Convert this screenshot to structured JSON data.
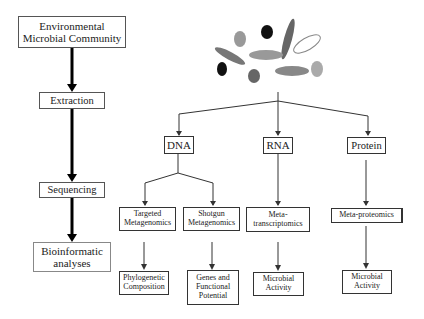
{
  "diagram": {
    "left_column": {
      "steps": [
        {
          "label_line1": "Environmental",
          "label_line2": "Microbial Community"
        },
        {
          "label_line1": "Extraction"
        },
        {
          "label_line1": "Sequencing"
        },
        {
          "label_line1": "Bioinformatic",
          "label_line2": "analyses"
        }
      ]
    },
    "molecules": [
      {
        "label": "DNA"
      },
      {
        "label": "RNA"
      },
      {
        "label": "Protein"
      }
    ],
    "methods": [
      {
        "line1": "Targeted",
        "line2": "Metagenomics"
      },
      {
        "line1": "Shotgun",
        "line2": "Metagenomics"
      },
      {
        "line1": "Meta-",
        "line2": "transcriptomics"
      },
      {
        "line1": "Meta-proteomics"
      }
    ],
    "outputs": [
      {
        "line1": "Phylogenetic",
        "line2": "Composition"
      },
      {
        "line1": "Genes and",
        "line2": "Functional",
        "line3": "Potential"
      },
      {
        "line1": "Microbial",
        "line2": "Activity"
      },
      {
        "line1": "Microbial",
        "line2": "Activity"
      }
    ],
    "colors": {
      "line": "#333333",
      "microbe_dark": "#111111",
      "microbe_mid": "#777777",
      "microbe_light": "#aaaaaa"
    }
  }
}
